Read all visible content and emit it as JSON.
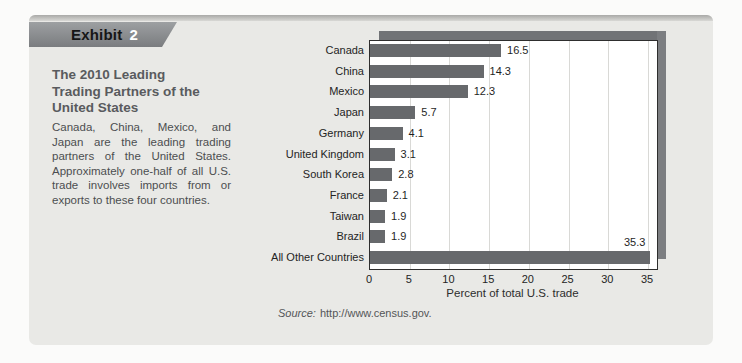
{
  "exhibit": {
    "label": "Exhibit",
    "number": "2"
  },
  "sidebar": {
    "title": "The 2010 Leading Trading Partners of the United States",
    "description": "Canada, China, Mexico, and Japan are the leading trading partners of the United States. Approximately one-half of all U.S. trade involves imports from or exports to these four countries."
  },
  "source": {
    "prefix": "Source:",
    "url": "http://www.census.gov."
  },
  "chart_data": {
    "type": "bar",
    "orientation": "horizontal",
    "categories": [
      "Canada",
      "China",
      "Mexico",
      "Japan",
      "Germany",
      "United Kingdom",
      "South Korea",
      "France",
      "Taiwan",
      "Brazil",
      "All Other Countries"
    ],
    "values": [
      16.5,
      14.3,
      12.3,
      5.7,
      4.1,
      3.1,
      2.8,
      2.1,
      1.9,
      1.9,
      35.3
    ],
    "value_labels": [
      "16.5",
      "14.3",
      "12.3",
      "5.7",
      "4.1",
      "3.1",
      "2.8",
      "2.1",
      "1.9",
      "1.9",
      "35.3"
    ],
    "value_label_positions": [
      "right",
      "right",
      "right",
      "right",
      "right",
      "right",
      "right",
      "right",
      "right",
      "right",
      "above"
    ],
    "xlabel": "Percent of total U.S. trade",
    "xticks": [
      0,
      5,
      10,
      15,
      20,
      25,
      30,
      35
    ],
    "xlim": [
      0,
      36
    ],
    "grid": "vertical",
    "legend": "none",
    "bar_color": "#67696c",
    "colors": {
      "plot_background": "#ffffff",
      "frame": "#2e2e2e",
      "gridline": "#d9d9d6",
      "shadow": "#717376",
      "card_background": "#e9e9e6"
    }
  }
}
